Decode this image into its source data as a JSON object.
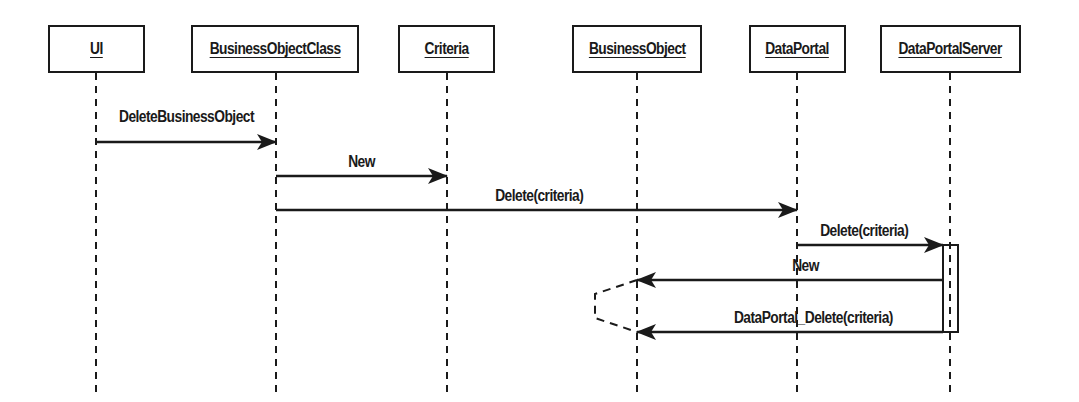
{
  "diagram": {
    "type": "uml-sequence",
    "objects": [
      {
        "id": "ui",
        "label": "UI",
        "box": {
          "x": 48,
          "y": 25,
          "w": 97,
          "h": 48
        },
        "lifeline_x": 96
      },
      {
        "id": "boc",
        "label": "BusinessObjectClass",
        "box": {
          "x": 191,
          "y": 25,
          "w": 168,
          "h": 48
        },
        "lifeline_x": 276
      },
      {
        "id": "criteria",
        "label": "Criteria",
        "box": {
          "x": 398,
          "y": 25,
          "w": 97,
          "h": 48
        },
        "lifeline_x": 447
      },
      {
        "id": "bo",
        "label": "BusinessObject",
        "box": {
          "x": 572,
          "y": 25,
          "w": 130,
          "h": 48
        },
        "lifeline_x": 637
      },
      {
        "id": "dp",
        "label": "DataPortal",
        "box": {
          "x": 749,
          "y": 25,
          "w": 97,
          "h": 48
        },
        "lifeline_x": 797
      },
      {
        "id": "dps",
        "label": "DataPortalServer",
        "box": {
          "x": 880,
          "y": 25,
          "w": 141,
          "h": 48
        },
        "lifeline_x": 950
      }
    ],
    "lifeline_end_y": 392,
    "messages": [
      {
        "label": "DeleteBusinessObject",
        "from": "ui",
        "to": "boc",
        "y": 142,
        "x1": 96,
        "x2": 276,
        "label_cx": 186,
        "label_y": 108
      },
      {
        "label": "New",
        "from": "boc",
        "to": "criteria",
        "y": 176,
        "x1": 276,
        "x2": 447,
        "label_cx": 361,
        "label_y": 153
      },
      {
        "label": "Delete(criteria)",
        "from": "boc",
        "to": "dp",
        "y": 210,
        "x1": 276,
        "x2": 797,
        "label_cx": 539,
        "label_y": 187
      },
      {
        "label": "Delete(criteria)",
        "from": "dp",
        "to": "dps",
        "y": 245,
        "x1": 797,
        "x2": 943,
        "label_cx": 864,
        "label_y": 222
      },
      {
        "label": "New",
        "from": "dps",
        "to": "bo",
        "y": 280,
        "x1": 943,
        "x2": 637,
        "label_cx": 805,
        "label_y": 257
      },
      {
        "label": "DataPortal_Delete(criteria)",
        "from": "dps",
        "to": "bo",
        "y": 332,
        "x1": 943,
        "x2": 637,
        "label_cx": 813,
        "label_y": 309
      }
    ],
    "activation": {
      "object": "dps",
      "x": 943,
      "y": 245,
      "w": 15,
      "h": 87
    },
    "self_link": {
      "object": "bo",
      "y1": 280,
      "y2": 332,
      "bulge_x": 595
    },
    "colors": {
      "line": "#1a1a1a",
      "background": "#ffffff"
    }
  }
}
